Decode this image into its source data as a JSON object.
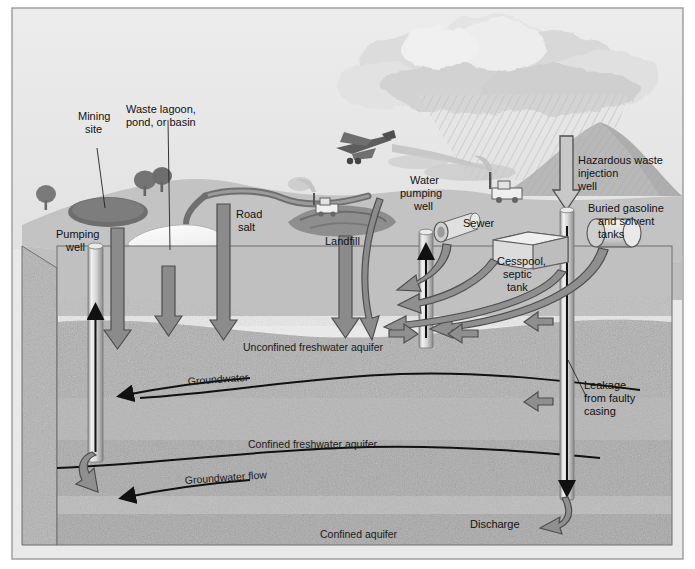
{
  "figure": {
    "frame_border_color": "#9a9a9a",
    "sky_color": "#e8e8e8",
    "ground_color": "#c0c0c0",
    "aquifer_color": "#b2b2b2",
    "text_color": "#111111"
  },
  "surface_labels": {
    "mining_site": "Mining\nsite",
    "mining_site_line1": "Mining",
    "mining_site_line2": "site",
    "waste_lagoon_line1": "Waste lagoon,",
    "waste_lagoon_line2": "pond, or basin",
    "pumping_well_line1": "Pumping",
    "pumping_well_line2": "well",
    "road_salt_line1": "Road",
    "road_salt_line2": "salt",
    "landfill": "Landfill",
    "water_pumping_well_line1": "Water",
    "water_pumping_well_line2": "pumping",
    "water_pumping_well_line3": "well",
    "sewer": "Sewer",
    "cesspool_line1": "Cesspool,",
    "cesspool_line2": "septic",
    "cesspool_line3": "tank",
    "hazardous_line1": "Hazardous waste",
    "hazardous_line2": "injection",
    "hazardous_line3": "well",
    "buried_tanks_line1": "Buried gasoline",
    "buried_tanks_line2": "and solvent",
    "buried_tanks_line3": "tanks"
  },
  "subsurface_labels": {
    "unconfined_aquifer": "Unconfined freshwater aquifer",
    "groundwater": "Groundwater",
    "confined_freshwater_aquifer": "Confined freshwater aquifer",
    "groundwater_flow": "Groundwater flow",
    "confined_aquifer": "Confined aquifer",
    "leakage_line1": "Leakage",
    "leakage_line2": "from faulty",
    "leakage_line3": "casing",
    "discharge": "Discharge"
  },
  "scene_elements": [
    {
      "name": "rain-cloud",
      "kind": "cloud"
    },
    {
      "name": "rainfall",
      "kind": "hatched-rain"
    },
    {
      "name": "crop-duster-airplane",
      "kind": "airplane"
    },
    {
      "name": "mountain",
      "kind": "hill"
    },
    {
      "name": "bulldozer",
      "kind": "vehicle"
    },
    {
      "name": "barge-vehicle",
      "kind": "vehicle"
    },
    {
      "name": "tree",
      "kind": "vegetation"
    },
    {
      "name": "river",
      "kind": "water"
    }
  ]
}
